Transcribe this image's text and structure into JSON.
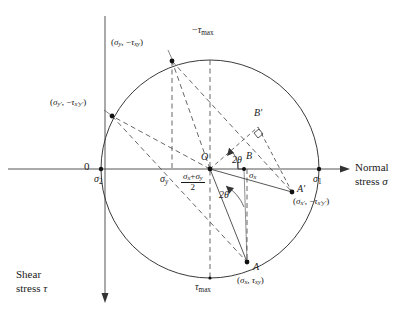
{
  "figure": {
    "type": "mohrs-circle",
    "background": "#ffffff",
    "stroke_color": "#3a3a3a",
    "text_color": "#1a1a1a"
  },
  "axes": {
    "horizontal": {
      "label_line1": "Normal",
      "label_line2": "stress σ",
      "origin_label": "0",
      "y_pixel": 169,
      "x_start": 8,
      "x_end": 345
    },
    "vertical": {
      "label_line1": "Shear",
      "label_line2": "stress τ",
      "x_pixel": 105,
      "y_start": 16,
      "y_end": 300
    }
  },
  "circle": {
    "center_x": 210,
    "center_y": 169,
    "radius": 109,
    "center_label": "O"
  },
  "points": [
    {
      "name": "sigma-2",
      "label": "σ₂",
      "label_main": "σ",
      "label_sub": "2",
      "x": 101,
      "y": 169,
      "dot": true
    },
    {
      "name": "sigma-1",
      "label": "σ₁",
      "label_main": "σ",
      "label_sub": "1",
      "x": 319,
      "y": 169,
      "dot": true
    },
    {
      "name": "point-A",
      "label": "A",
      "coord_label": "(σx, τxy)",
      "x": 247,
      "y": 262,
      "dot": true
    },
    {
      "name": "point-A-prime",
      "label": "A′",
      "coord_label": "(σx′, −τx′y′)",
      "x": 292,
      "y": 192,
      "dot": true
    },
    {
      "name": "point-sigma-y",
      "label": "(σy, −τxy)",
      "x": 172,
      "y": 61,
      "dot": true
    },
    {
      "name": "point-sigma-y-prime",
      "label": "(σy′, −τx′y′)",
      "x": 112,
      "y": 116,
      "dot": true
    },
    {
      "name": "point-B",
      "label": "B",
      "x": 244,
      "y": 169,
      "dot": true
    },
    {
      "name": "point-B-prime",
      "label": "B′",
      "x": 258,
      "y": 127,
      "dot": false
    },
    {
      "name": "tau-max-bottom-point",
      "label": "τmax",
      "x": 210,
      "y": 278,
      "dot": false
    },
    {
      "name": "tau-max-top-point",
      "label": "−τmax",
      "x": 210,
      "y": 60,
      "dot": false
    }
  ],
  "labels": {
    "zero": "0",
    "sigma_1": {
      "base": "σ",
      "sub": "1"
    },
    "sigma_2": {
      "base": "σ",
      "sub": "2"
    },
    "sigma_x": {
      "base": "σ",
      "sub": "x"
    },
    "sigma_y": {
      "base": "σ",
      "sub": "y"
    },
    "center": "O",
    "point_A": "A",
    "point_A_prime": "A′",
    "point_B": "B",
    "point_B_prime": "B′",
    "tau_max_top": {
      "sign": "−",
      "base": "τ",
      "sub": "max"
    },
    "tau_max_bottom": {
      "sign": "",
      "base": "τ",
      "sub": "max"
    },
    "center_formula": {
      "numerator_a": "σ",
      "numerator_a_sub": "x",
      "plus": "+",
      "numerator_b": "σ",
      "numerator_b_sub": "y",
      "denominator": "2"
    },
    "angle_upper": "2θ",
    "angle_lower": "2θ",
    "coord_A": {
      "open": "(",
      "s_base": "σ",
      "s_sub": "x",
      "comma": ", ",
      "t_base": "τ",
      "t_sub": "xy",
      "close": ")"
    },
    "coord_A_prime": {
      "open": "(",
      "s_base": "σ",
      "s_sub": "x′",
      "comma": ", −",
      "t_base": "τ",
      "t_sub": "x′y′",
      "close": ")"
    },
    "coord_sigma_y": {
      "open": "(",
      "s_base": "σ",
      "s_sub": "y",
      "comma": ", −",
      "t_base": "τ",
      "t_sub": "xy",
      "close": ")"
    },
    "coord_sigma_y_prime": {
      "open": "(",
      "s_base": "σ",
      "s_sub": "y′",
      "comma": ", −",
      "t_base": "τ",
      "t_sub": "x′y′",
      "close": ")"
    },
    "axis_normal_line1": "Normal",
    "axis_normal_line2a": "stress ",
    "axis_normal_line2b": "σ",
    "axis_shear_line1": "Shear",
    "axis_shear_line2a": "stress ",
    "axis_shear_line2b": "τ"
  }
}
